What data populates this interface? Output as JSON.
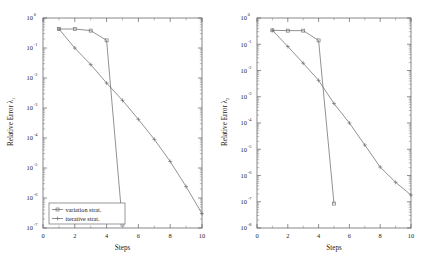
{
  "figure": {
    "background_color": "#ffffff",
    "axis_color": "#55555a",
    "panel_count": 2
  },
  "chart_data": [
    {
      "type": "line",
      "panel": "left",
      "title": "",
      "xlabel": "Steps",
      "ylabel": "Relative Error λ₁",
      "ylabel_base": "Relative Error",
      "ylabel_symbol": "λ",
      "ylabel_subscript": "1",
      "xscale": "linear",
      "yscale": "log",
      "xlim": [
        0,
        10
      ],
      "ylim": [
        1e-07,
        1
      ],
      "grid": false,
      "xticks": [
        0,
        2,
        4,
        6,
        8,
        10
      ],
      "xtick_labels": [
        "0",
        "2",
        "4",
        "6",
        "8",
        "10"
      ],
      "yticks": [
        1,
        0.1,
        0.01,
        0.001,
        0.0001,
        1e-05,
        1e-06,
        1e-07
      ],
      "ytick_labels": [
        "10^0",
        "10^-1",
        "10^-2",
        "10^-3",
        "10^-4",
        "10^-5",
        "10^-6",
        "10^-7"
      ],
      "ytick_exponents": [
        "0",
        "-1",
        "-2",
        "-3",
        "-4",
        "-5",
        "-6",
        "-7"
      ],
      "legend_position": "lower left",
      "series": [
        {
          "name": "variation strat.",
          "marker": "square",
          "color": "#6e6e73",
          "x": [
            1,
            2,
            3,
            4,
            5
          ],
          "values": [
            0.43,
            0.43,
            0.38,
            0.18,
            1.3e-07
          ]
        },
        {
          "name": "iterative strat.",
          "marker": "plus",
          "color": "#6e6e73",
          "x": [
            1,
            2,
            3,
            4,
            5,
            6,
            7,
            8,
            9,
            10
          ],
          "values": [
            0.43,
            0.1,
            0.028,
            0.0068,
            0.0018,
            0.00042,
            9e-05,
            1.65e-05,
            2.4e-06,
            3e-07
          ]
        }
      ]
    },
    {
      "type": "line",
      "panel": "right",
      "title": "",
      "xlabel": "Steps",
      "ylabel": "Relative Error λ₂",
      "ylabel_base": "Relative Error",
      "ylabel_symbol": "λ",
      "ylabel_subscript": "2",
      "xscale": "linear",
      "yscale": "log",
      "xlim": [
        0,
        10
      ],
      "ylim": [
        1e-08,
        1
      ],
      "grid": false,
      "xticks": [
        0,
        2,
        4,
        6,
        8,
        10
      ],
      "xtick_labels": [
        "0",
        "2",
        "4",
        "6",
        "8",
        "10"
      ],
      "yticks": [
        1,
        0.1,
        0.01,
        0.001,
        0.0001,
        1e-05,
        1e-06,
        1e-07,
        1e-08
      ],
      "ytick_labels": [
        "10^0",
        "10^-1",
        "10^-2",
        "10^-3",
        "10^-4",
        "10^-5",
        "10^-6",
        "10^-7",
        "10^-8"
      ],
      "ytick_exponents": [
        "0",
        "-1",
        "-2",
        "-3",
        "-4",
        "-5",
        "-6",
        "-7",
        "-8"
      ],
      "legend_position": "none",
      "series": [
        {
          "name": "variation strat.",
          "marker": "square",
          "color": "#6e6e73",
          "x": [
            1,
            2,
            3,
            4,
            5
          ],
          "values": [
            0.34,
            0.33,
            0.33,
            0.14,
            8.5e-08
          ]
        },
        {
          "name": "iterative strat.",
          "marker": "plus",
          "color": "#6e6e73",
          "x": [
            1,
            2,
            3,
            4,
            5,
            6,
            7,
            8,
            9,
            10
          ],
          "values": [
            0.34,
            0.082,
            0.019,
            0.0042,
            0.00055,
            0.0001,
            1.45e-05,
            2.1e-06,
            5.5e-07,
            1.8e-07
          ]
        }
      ]
    }
  ]
}
